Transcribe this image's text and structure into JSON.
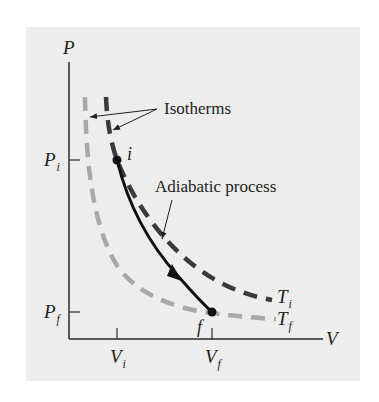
{
  "diagram": {
    "axes": {
      "y_label": "P",
      "x_label": "V",
      "y_ticks": [
        {
          "base": "P",
          "sub": "i"
        },
        {
          "base": "P",
          "sub": "f"
        }
      ],
      "x_ticks": [
        {
          "base": "V",
          "sub": "i"
        },
        {
          "base": "V",
          "sub": "f"
        }
      ]
    },
    "points": [
      {
        "label": "i",
        "description": "initial state (Vi, Pi)"
      },
      {
        "label": "f",
        "description": "final state (Vf, Pf)"
      }
    ],
    "curves": [
      {
        "name": "Ti isotherm",
        "label_base": "T",
        "label_sub": "i",
        "style": "dashed",
        "color": "#3a3a3a"
      },
      {
        "name": "Tf isotherm",
        "label_base": "T",
        "label_sub": "f",
        "style": "dashed",
        "color": "#a8a8a8"
      },
      {
        "name": "Adiabatic process",
        "style": "solid",
        "color": "#111111",
        "direction": "i to f"
      }
    ],
    "annotations": {
      "isotherms": "Isotherms",
      "adiabatic": "Adiabatic process"
    },
    "colors": {
      "background_panel": "#ededeb",
      "axis": "#2a2a2a",
      "isotherm_hot": "#3a3a3a",
      "isotherm_cold": "#a8a8a8",
      "adiabat": "#111111"
    }
  }
}
